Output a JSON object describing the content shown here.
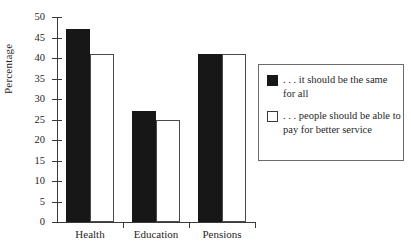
{
  "chart_data": {
    "type": "bar",
    "title": "",
    "xlabel": "",
    "ylabel": "Percentage",
    "ylim": [
      0,
      50
    ],
    "yticks": [
      0,
      5,
      10,
      15,
      20,
      25,
      30,
      35,
      40,
      45,
      50
    ],
    "grid": false,
    "legend_position": "right",
    "categories": [
      "Health",
      "Education",
      "Pensions"
    ],
    "series": [
      {
        "name": "... it should be the same for all",
        "color": "#171717",
        "values": [
          47,
          27,
          41
        ]
      },
      {
        "name": "... people should be able to pay for better service",
        "color": "#ffffff",
        "values": [
          41,
          25,
          41
        ]
      }
    ]
  },
  "legend": {
    "entries": [
      {
        "label": ". . . it should be the same for all",
        "swatch": "filled-square-dark"
      },
      {
        "label": ". . . people should be able to pay for better service",
        "swatch": "open-square-light"
      }
    ]
  },
  "axis": {
    "y_title": "Percentage",
    "y_tick_labels": [
      "50",
      "45",
      "40",
      "35",
      "30",
      "25",
      "20",
      "15",
      "10",
      "5",
      "0"
    ],
    "x_tick_labels": [
      "Health",
      "Education",
      "Pensions"
    ]
  }
}
